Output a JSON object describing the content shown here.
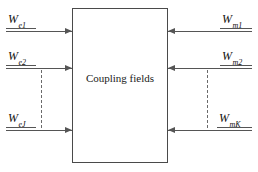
{
  "diagram": {
    "block": {
      "label": "Coupling fields",
      "border_color": "#4a4a4a",
      "fill_color": "#ffffff"
    },
    "line_color": "#555555",
    "text_color": "#111111",
    "inputs_left": [
      {
        "base": "W",
        "subscript": "e1",
        "full": "W_e1",
        "direction": "into-block"
      },
      {
        "base": "W",
        "subscript": "e2",
        "full": "W_e2",
        "direction": "into-block"
      },
      {
        "base": "W",
        "subscript": "eJ",
        "full": "W_eJ",
        "direction": "into-block"
      }
    ],
    "inputs_right": [
      {
        "base": "W",
        "subscript": "m1",
        "full": "W_m1",
        "direction": "into-block"
      },
      {
        "base": "W",
        "subscript": "m2",
        "full": "W_m2",
        "direction": "into-block"
      },
      {
        "base": "W",
        "subscript": "mK",
        "full": "W_mK",
        "direction": "into-block"
      }
    ],
    "ellipsis": {
      "left_marker": "vertical-dashed-line",
      "right_marker": "vertical-dashed-line"
    }
  }
}
